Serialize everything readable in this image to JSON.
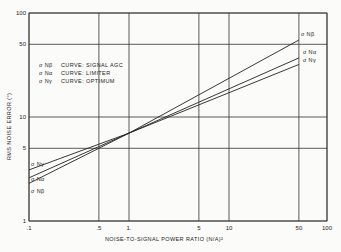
{
  "chart_data": {
    "type": "line",
    "title": "",
    "xlabel": "NOISE-TO-SIGNAL POWER RATIO (N/A)²",
    "ylabel": "RMS NOISE ERROR (°)",
    "xscale": "log",
    "yscale": "log",
    "xlim": [
      0.1,
      100
    ],
    "ylim": [
      1,
      100
    ],
    "x_ticks": [
      ".1",
      ".5",
      "1.",
      "5",
      "10",
      "50",
      "100"
    ],
    "y_ticks": [
      "1",
      "5",
      "10",
      "50",
      "100"
    ],
    "grid": true,
    "legend": [
      {
        "symbol": "σ Nβ",
        "text": "CURVE: SIGNAL AGC"
      },
      {
        "symbol": "σ Nα",
        "text": "CURVE: LIMITER"
      },
      {
        "symbol": "σ Nγ",
        "text": "CURVE: OPTIMUM"
      }
    ],
    "series": [
      {
        "name": "σ Nβ",
        "x": [
          0.1,
          1,
          50
        ],
        "values": [
          2.3,
          7.0,
          55
        ]
      },
      {
        "name": "σ Nα",
        "x": [
          0.1,
          1,
          50
        ],
        "values": [
          2.6,
          7.0,
          37
        ]
      },
      {
        "name": "σ Nγ",
        "x": [
          0.1,
          1,
          50
        ],
        "values": [
          3.1,
          7.0,
          32
        ]
      }
    ]
  }
}
